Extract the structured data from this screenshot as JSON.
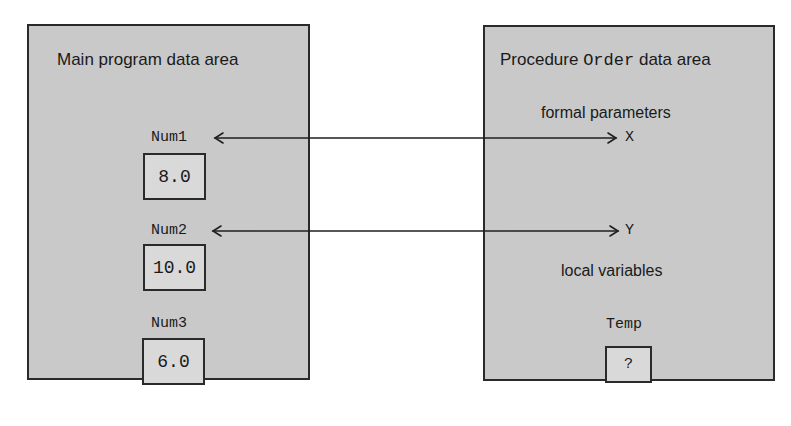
{
  "main_panel": {
    "title": "Main program data area",
    "variables": [
      {
        "name": "Num1",
        "value": "8.0"
      },
      {
        "name": "Num2",
        "value": "10.0"
      },
      {
        "name": "Num3",
        "value": "6.0"
      }
    ]
  },
  "procedure_panel": {
    "title_prefix": "Procedure",
    "title_name": "Order",
    "title_suffix": "data area",
    "formal_parameters_label": "formal parameters",
    "parameters": [
      {
        "name": "X"
      },
      {
        "name": "Y"
      }
    ],
    "local_variables_label": "local variables",
    "locals": [
      {
        "name": "Temp",
        "value": "?"
      }
    ]
  },
  "connections": [
    {
      "from": "Num1",
      "to": "X",
      "style": "double-arrow"
    },
    {
      "from": "Num2",
      "to": "Y",
      "style": "double-arrow"
    }
  ],
  "colors": {
    "panel_fill": "#c9c9c9",
    "value_box_fill": "#d9d9d9",
    "stroke": "#2a2a2a"
  }
}
